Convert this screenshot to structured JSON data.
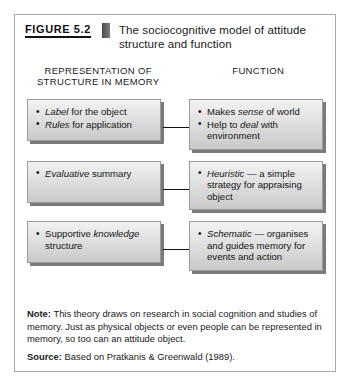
{
  "figure": {
    "number": "FIGURE 5.2",
    "title": "The sociocognitive model of attitude structure and function"
  },
  "columns": {
    "left": "REPRESENTATION OF STRUCTURE IN MEMORY",
    "right": "FUNCTION"
  },
  "rows": [
    {
      "left_items": [
        {
          "em": "Label",
          "rest": " for the object"
        },
        {
          "em": "Rules",
          "rest": " for application"
        }
      ],
      "right_items": [
        {
          "pre": "Makes ",
          "em": "sense",
          "rest": " of world"
        },
        {
          "pre": "Help to ",
          "em": "deal",
          "rest": " with environment"
        }
      ],
      "arrow_label": "arrow-row-1"
    },
    {
      "left_items": [
        {
          "em": "Evaluative",
          "rest": " summary"
        }
      ],
      "right_items": [
        {
          "em": "Heuristic",
          "rest": " — a simple strategy for appraising object"
        }
      ],
      "arrow_label": "arrow-row-2"
    },
    {
      "left_items": [
        {
          "pre": "Supportive ",
          "em": "knowledge",
          "rest": " structure"
        }
      ],
      "right_items": [
        {
          "em": "Schematic",
          "rest": " — organises and guides memory for events and action"
        }
      ],
      "arrow_label": "arrow-row-3"
    }
  ],
  "footer": {
    "note_label": "Note:",
    "note_text": " This theory draws on research in social cognition and studies of memory. Just as physical objects or even people can be represented in memory, so too can an attitude object.",
    "source_label": "Source:",
    "source_text": " Based on Pratkanis & Greenwald (1989)."
  },
  "colors": {
    "frame_border": "#a8a8a8",
    "node_fill_top": "#f2f2f2",
    "node_fill_bottom": "#c9c9c9",
    "node_shadow": "#282828",
    "text": "#1a1a1a"
  }
}
